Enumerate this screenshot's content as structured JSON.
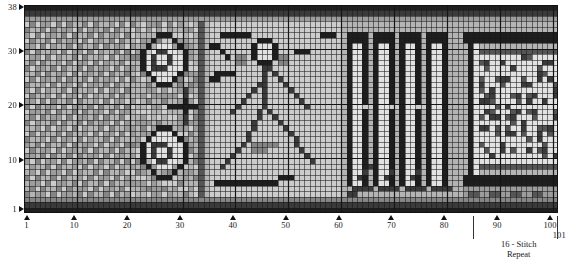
{
  "chart_data": {
    "type": "heatmap",
    "title": "",
    "xlabel": "",
    "ylabel": "",
    "xlim": [
      1,
      101
    ],
    "ylim": [
      1,
      38
    ],
    "grid": true,
    "legend_position": "none",
    "columns": 101,
    "rows": 38,
    "cell_size_px": 5.28,
    "x_ticks": [
      1,
      10,
      20,
      30,
      40,
      50,
      60,
      70,
      80,
      90,
      100,
      101
    ],
    "y_ticks": [
      1,
      10,
      20,
      30,
      38
    ],
    "palette": [
      "#1e1e1e",
      "#3a3a3a",
      "#555555",
      "#6e6e6e",
      "#858585",
      "#9c9c9c",
      "#b4b4b4",
      "#cccccc",
      "#e2e2e2",
      "#f2f2f2"
    ],
    "gridline_color": "#3c3c3c",
    "emphasis_line_color": "#151515"
  },
  "axes": {
    "y_axis": {
      "name": "row-axis",
      "ticks": [
        {
          "label": "38",
          "value": 38
        },
        {
          "label": "30",
          "value": 30
        },
        {
          "label": "20",
          "value": 20
        },
        {
          "label": "10",
          "value": 10
        },
        {
          "label": "1",
          "value": 1
        }
      ]
    },
    "x_axis": {
      "name": "stitch-axis",
      "ticks": [
        {
          "label": "1",
          "value": 1
        },
        {
          "label": "10",
          "value": 10
        },
        {
          "label": "20",
          "value": 20
        },
        {
          "label": "30",
          "value": 30
        },
        {
          "label": "40",
          "value": 40
        },
        {
          "label": "50",
          "value": 50
        },
        {
          "label": "60",
          "value": 60
        },
        {
          "label": "70",
          "value": 70
        },
        {
          "label": "80",
          "value": 80
        },
        {
          "label": "90",
          "value": 90
        },
        {
          "label": "100",
          "value": 100
        },
        {
          "label": "101",
          "value": 101
        }
      ]
    }
  },
  "repeat": {
    "line1": "16 - Stitch",
    "line2": "Repeat",
    "start_stitch": 86,
    "end_stitch": 101
  }
}
